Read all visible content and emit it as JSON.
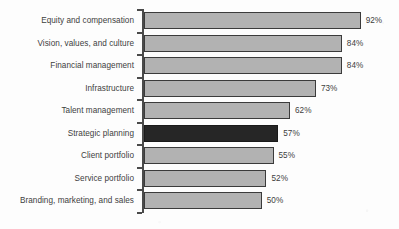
{
  "chart_data": {
    "type": "bar",
    "orientation": "horizontal",
    "title": "",
    "subtitle": "",
    "xlabel": "",
    "ylabel": "",
    "xlim": [
      0,
      92
    ],
    "grid": false,
    "legend": null,
    "value_suffix": "%",
    "categories": [
      "Equity and compensation",
      "Vision, values, and culture",
      "Financial management",
      "Infrastructure",
      "Talent management",
      "Strategic planning",
      "Client portfolio",
      "Service portfolio",
      "Branding, marketing, and sales"
    ],
    "values": [
      92,
      84,
      84,
      73,
      62,
      57,
      55,
      52,
      50
    ],
    "data_labels": [
      "92%",
      "84%",
      "84%",
      "73%",
      "62%",
      "57%",
      "55%",
      "52%",
      "50%"
    ],
    "highlight_index": 5,
    "highlight_category": "Strategic planning",
    "colors": {
      "bar_fill": "#b2b2b2",
      "bar_border": "#3b3b3b",
      "highlight_fill": "#262626",
      "highlight_border": "#1a1a1a",
      "axis": "#4a4a4a",
      "text": "#3d3d3d",
      "background": "#fdfdfd"
    },
    "bars": [
      {
        "label": "Equity and compensation",
        "value": 92,
        "display": "92%",
        "highlight": false
      },
      {
        "label": "Vision, values, and culture",
        "value": 84,
        "display": "84%",
        "highlight": false
      },
      {
        "label": "Financial management",
        "value": 84,
        "display": "84%",
        "highlight": false
      },
      {
        "label": "Infrastructure",
        "value": 73,
        "display": "73%",
        "highlight": false
      },
      {
        "label": "Talent management",
        "value": 62,
        "display": "62%",
        "highlight": false
      },
      {
        "label": "Strategic planning",
        "value": 57,
        "display": "57%",
        "highlight": true
      },
      {
        "label": "Client portfolio",
        "value": 55,
        "display": "55%",
        "highlight": false
      },
      {
        "label": "Service portfolio",
        "value": 52,
        "display": "52%",
        "highlight": false
      },
      {
        "label": "Branding, marketing, and sales",
        "value": 50,
        "display": "50%",
        "highlight": false
      }
    ]
  }
}
